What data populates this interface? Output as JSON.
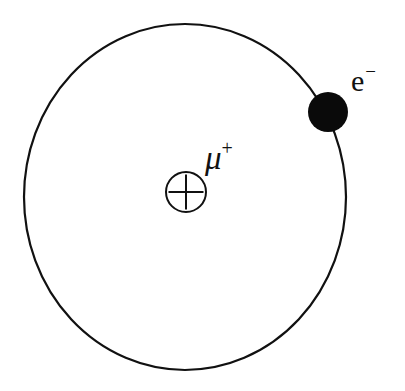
{
  "figure": {
    "background_color": "#ffffff",
    "stroke_color": "#111111",
    "width": 405,
    "height": 391
  },
  "orbit": {
    "name": "electron-orbit",
    "shape": "ellipse",
    "center_x": 185,
    "center_y": 197,
    "radius_x": 161,
    "radius_y": 173,
    "stroke_width": 2.2,
    "stroke_color": "#111111",
    "fill": "none"
  },
  "nucleus": {
    "name": "muon-nucleus",
    "symbol": "circled-plus",
    "center_x": 186,
    "center_y": 192,
    "radius": 20,
    "stroke_width": 2.0,
    "stroke_color": "#111111",
    "label_base": "μ",
    "label_superscript": "+",
    "label_full": "μ⁺"
  },
  "electron": {
    "name": "electron-particle",
    "center_x": 328,
    "center_y": 112,
    "radius": 20,
    "fill_color": "#0a0a0a",
    "label_base": "e",
    "label_superscript": "−",
    "label_full": "e⁻"
  }
}
